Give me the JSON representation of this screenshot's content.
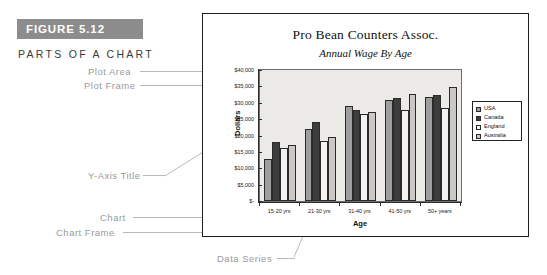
{
  "figure": {
    "badge_label": "FIGURE 5.12",
    "caption": "PARTS OF A CHART",
    "badge_color": "#8c8c8c"
  },
  "callouts": {
    "plot_area": "Plot Area",
    "plot_frame": "Plot Frame",
    "y_axis_title": "Y-Axis Title",
    "chart": "Chart",
    "chart_frame": "Chart Frame",
    "y_axis": "Y-Axis",
    "data_series": "Data Series",
    "title": "Title",
    "subtitle": "Sub-title",
    "legend": "Legend",
    "x_axis": "X-Axis",
    "x_axis_title": "X-Axis Title"
  },
  "chart_data": {
    "type": "bar",
    "title": "Pro Bean Counters Assoc.",
    "subtitle": "Annual Wage By Age",
    "xlabel": "Age",
    "ylabel": "Dollars",
    "ylim": [
      0,
      40000
    ],
    "grid": false,
    "legend_position": "right",
    "categories": [
      "15-20 yrs",
      "21-30 yrs",
      "31-40 yrs",
      "41-50 yrs",
      "50+ years"
    ],
    "ytick_labels": [
      "$40,000",
      "$35,000",
      "$30,000",
      "$25,000",
      "$20,000",
      "$15,000",
      "$10,000",
      "$5,000",
      "$-"
    ],
    "ytick_values": [
      40000,
      35000,
      30000,
      25000,
      20000,
      15000,
      10000,
      5000,
      0
    ],
    "series": [
      {
        "name": "USA",
        "color": "#9e9e9e",
        "values": [
          12700,
          22000,
          29000,
          30700,
          31700
        ]
      },
      {
        "name": "Canada",
        "color": "#3d3d3d",
        "values": [
          18000,
          24000,
          27800,
          31400,
          32500
        ]
      },
      {
        "name": "England",
        "color": "#f3f2f0",
        "values": [
          16300,
          18200,
          26700,
          27800,
          28400
        ]
      },
      {
        "name": "Australia",
        "color": "#c9c8c4",
        "values": [
          17200,
          19500,
          27200,
          32800,
          34800
        ]
      }
    ]
  }
}
